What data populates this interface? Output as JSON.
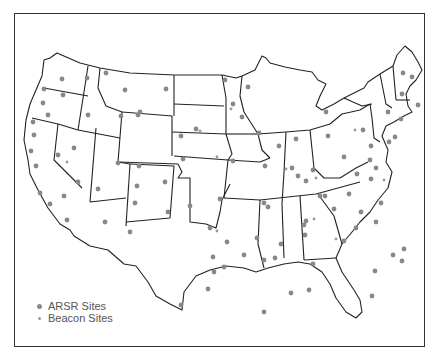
{
  "map": {
    "title": "",
    "region": "Contiguous United States",
    "colors": {
      "ars_dot": "#888888",
      "beacon_dot": "#999999",
      "lines": "#222222"
    }
  },
  "legend": {
    "items": [
      {
        "label": "ARSR Sites",
        "marker": "large-dot"
      },
      {
        "label": "Beacon Sites",
        "marker": "small-dot"
      }
    ]
  },
  "arsr_sites": [
    [
      62,
      79
    ],
    [
      87,
      78
    ],
    [
      106,
      73
    ],
    [
      44,
      89
    ],
    [
      63,
      95
    ],
    [
      43,
      103
    ],
    [
      48,
      115
    ],
    [
      88,
      115
    ],
    [
      121,
      116
    ],
    [
      33,
      122
    ],
    [
      34,
      135
    ],
    [
      31,
      151
    ],
    [
      36,
      166
    ],
    [
      74,
      148
    ],
    [
      58,
      155
    ],
    [
      78,
      182
    ],
    [
      40,
      193
    ],
    [
      64,
      196
    ],
    [
      50,
      204
    ],
    [
      67,
      220
    ],
    [
      98,
      189
    ],
    [
      118,
      163
    ],
    [
      139,
      166
    ],
    [
      138,
      115
    ],
    [
      125,
      90
    ],
    [
      166,
      89
    ],
    [
      140,
      112
    ],
    [
      137,
      186
    ],
    [
      105,
      222
    ],
    [
      135,
      203
    ],
    [
      130,
      232
    ],
    [
      165,
      182
    ],
    [
      168,
      212
    ],
    [
      190,
      206
    ],
    [
      210,
      228
    ],
    [
      214,
      272
    ],
    [
      213,
      257
    ],
    [
      181,
      305
    ],
    [
      224,
      267
    ],
    [
      244,
      255
    ],
    [
      208,
      289
    ],
    [
      227,
      242
    ],
    [
      220,
      199
    ],
    [
      183,
      159
    ],
    [
      181,
      136
    ],
    [
      196,
      129
    ],
    [
      233,
      161
    ],
    [
      265,
      166
    ],
    [
      242,
      117
    ],
    [
      264,
      203
    ],
    [
      257,
      238
    ],
    [
      268,
      207
    ],
    [
      275,
      258
    ],
    [
      225,
      80
    ],
    [
      248,
      87
    ],
    [
      233,
      104
    ],
    [
      259,
      133
    ],
    [
      279,
      146
    ],
    [
      292,
      168
    ],
    [
      306,
      181
    ],
    [
      313,
      170
    ],
    [
      320,
      196
    ],
    [
      298,
      176
    ],
    [
      304,
      225
    ],
    [
      281,
      244
    ],
    [
      264,
      260
    ],
    [
      264,
      312
    ],
    [
      291,
      293
    ],
    [
      305,
      235
    ],
    [
      309,
      290
    ],
    [
      313,
      264
    ],
    [
      306,
      221
    ],
    [
      325,
      196
    ],
    [
      334,
      209
    ],
    [
      349,
      194
    ],
    [
      370,
      160
    ],
    [
      371,
      179
    ],
    [
      357,
      174
    ],
    [
      376,
      168
    ],
    [
      361,
      212
    ],
    [
      344,
      241
    ],
    [
      393,
      255
    ],
    [
      404,
      249
    ],
    [
      376,
      222
    ],
    [
      372,
      296
    ],
    [
      402,
      261
    ],
    [
      356,
      228
    ],
    [
      375,
      271
    ],
    [
      381,
      203
    ],
    [
      389,
      142
    ],
    [
      395,
      137
    ],
    [
      401,
      119
    ],
    [
      403,
      73
    ],
    [
      412,
      77
    ],
    [
      418,
      105
    ],
    [
      402,
      94
    ],
    [
      388,
      112
    ],
    [
      371,
      146
    ],
    [
      363,
      130
    ],
    [
      344,
      157
    ],
    [
      328,
      136
    ],
    [
      326,
      112
    ],
    [
      296,
      139
    ]
  ],
  "beacon_sites": [
    [
      67,
      162
    ],
    [
      200,
      131
    ],
    [
      217,
      157
    ],
    [
      231,
      109
    ],
    [
      314,
      219
    ],
    [
      355,
      130
    ],
    [
      384,
      180
    ],
    [
      316,
      178
    ],
    [
      336,
      239
    ],
    [
      286,
      169
    ],
    [
      217,
      231
    ]
  ]
}
